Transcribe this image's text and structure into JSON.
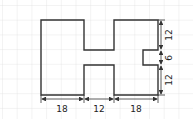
{
  "diagram": {
    "type": "dimensioned-shape",
    "dimensions": {
      "bottom": [
        "18",
        "12",
        "18"
      ],
      "right": [
        "12",
        "6",
        "12"
      ]
    },
    "colors": {
      "grid": "#e3e3e3",
      "outline": "#333333",
      "background": "#ffffff"
    }
  }
}
